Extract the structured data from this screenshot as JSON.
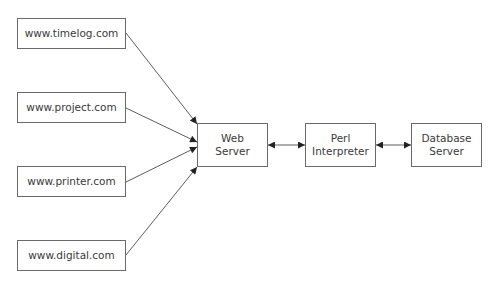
{
  "sources": [
    {
      "label": "www.timelog.com"
    },
    {
      "label": "www.project.com"
    },
    {
      "label": "www.printer.com"
    },
    {
      "label": "www.digital.com"
    }
  ],
  "web_server": {
    "line1": "Web",
    "line2": "Server"
  },
  "perl": {
    "line1": "Perl",
    "line2": "Interpreter"
  },
  "database": {
    "line1": "Database",
    "line2": "Server"
  },
  "colors": {
    "line": "#333333",
    "border": "#6a6a6a",
    "text": "#3a3a3a"
  }
}
